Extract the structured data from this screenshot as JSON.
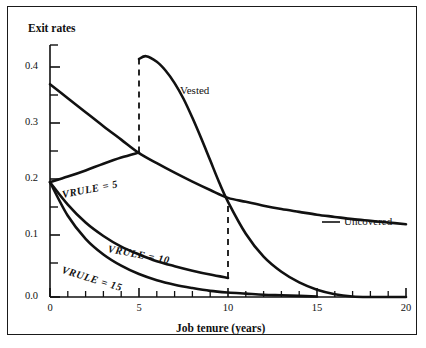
{
  "figure": {
    "top_bleed_text": "",
    "background_color": "#ffffff",
    "line_color": "#111111",
    "frame_color": "#1a1a1a"
  },
  "axes": {
    "y_title": "Exit rates",
    "x_title": "Job tenure (years)",
    "y_tick_labels": [
      "0.4",
      "0.3",
      "0.2",
      "0.1",
      "0.0"
    ],
    "x_tick_labels": [
      "0",
      "5",
      "10",
      "15",
      "20"
    ]
  },
  "labels": {
    "vested": "Vested",
    "uncovered": "Uncovered",
    "vrule_5": "VRULE = 5",
    "vrule_10": "VRULE = 10",
    "vrule_15": "VRULE = 15"
  },
  "chart_data": {
    "type": "line",
    "title": "",
    "xlabel": "Job tenure (years)",
    "ylabel": "Exit rates",
    "xlim": [
      0,
      20
    ],
    "ylim": [
      0.0,
      0.45
    ],
    "xticks": [
      0,
      1,
      2,
      3,
      4,
      5,
      6,
      7,
      8,
      9,
      10,
      11,
      12,
      13,
      14,
      15,
      16,
      17,
      18,
      19,
      20
    ],
    "xtick_major": [
      0,
      5,
      10,
      15,
      20
    ],
    "yticks": [
      0.0,
      0.05,
      0.1,
      0.15,
      0.2,
      0.25,
      0.3,
      0.35,
      0.4,
      0.45
    ],
    "ytick_major": [
      0.0,
      0.1,
      0.2,
      0.3,
      0.4
    ],
    "grid": false,
    "legend": "inline-annotations",
    "series": [
      {
        "name": "Uncovered",
        "style": "solid",
        "annotation": "Uncovered",
        "x": [
          0,
          1,
          2,
          3,
          4,
          5,
          6,
          7,
          8,
          9,
          10,
          11,
          12,
          13,
          14,
          15,
          16,
          17,
          18,
          19,
          20
        ],
        "y": [
          0.38,
          0.355,
          0.33,
          0.305,
          0.281,
          0.257,
          0.239,
          0.222,
          0.206,
          0.191,
          0.177,
          0.17,
          0.163,
          0.157,
          0.152,
          0.147,
          0.143,
          0.139,
          0.136,
          0.133,
          0.13
        ]
      },
      {
        "name": "Vested",
        "style": "solid",
        "annotation": "Vested",
        "note": "rises vertically (dashed) at tenure 5 from the VRULE=5 hazard, peaks just after 5, then declines to near zero by 17",
        "x": [
          5,
          5.4,
          6,
          6.5,
          7,
          7.5,
          8,
          8.5,
          9,
          9.5,
          10,
          11,
          12,
          13,
          14,
          15,
          16,
          17,
          18,
          19,
          20
        ],
        "y": [
          0.425,
          0.43,
          0.42,
          0.404,
          0.382,
          0.354,
          0.32,
          0.283,
          0.244,
          0.205,
          0.17,
          0.113,
          0.072,
          0.045,
          0.026,
          0.013,
          0.005,
          0.001,
          0.0,
          0.0,
          0.0
        ]
      },
      {
        "name": "VRULE = 5",
        "style": "solid",
        "annotation": "VRULE = 5",
        "x": [
          0,
          1,
          2,
          3,
          4,
          5
        ],
        "y": [
          0.205,
          0.215,
          0.226,
          0.238,
          0.249,
          0.258
        ]
      },
      {
        "name": "VRULE = 10",
        "style": "solid",
        "annotation": "VRULE = 10",
        "x": [
          0,
          1,
          2,
          3,
          4,
          5,
          6,
          7,
          8,
          9,
          10
        ],
        "y": [
          0.205,
          0.165,
          0.133,
          0.109,
          0.09,
          0.076,
          0.064,
          0.055,
          0.047,
          0.04,
          0.034
        ]
      },
      {
        "name": "VRULE = 15",
        "style": "solid",
        "annotation": "VRULE = 15",
        "x": [
          0,
          1,
          2,
          3,
          4,
          5,
          6,
          7,
          8,
          9,
          10,
          11,
          12,
          13,
          14,
          15
        ],
        "y": [
          0.205,
          0.145,
          0.104,
          0.076,
          0.056,
          0.041,
          0.03,
          0.022,
          0.016,
          0.011,
          0.008,
          0.006,
          0.004,
          0.003,
          0.002,
          0.001
        ]
      }
    ],
    "dashed_markers": [
      {
        "name": "vrule-5-marker",
        "x": 5,
        "y_from": 0.258,
        "y_to": 0.425
      },
      {
        "name": "vrule-10-marker",
        "x": 10,
        "y_from": 0.034,
        "y_to": 0.172
      }
    ]
  }
}
